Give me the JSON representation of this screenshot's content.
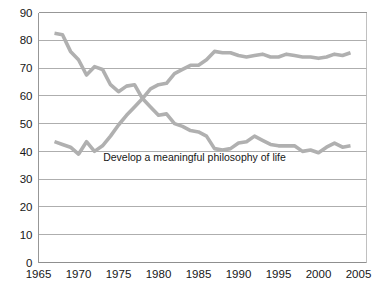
{
  "page": {
    "cropped_title_fragment": "",
    "background_color": "#ffffff"
  },
  "chart_data": {
    "type": "line",
    "title": "",
    "subtitle": "",
    "xlabel": "",
    "ylabel": "",
    "xlim": [
      1965,
      2006
    ],
    "ylim": [
      0,
      90
    ],
    "y_tick_labels": [
      "0",
      "10",
      "20",
      "30",
      "40",
      "50",
      "60",
      "70",
      "80",
      "90"
    ],
    "y_ticks": [
      0,
      10,
      20,
      30,
      40,
      50,
      60,
      70,
      80,
      90
    ],
    "x_tick_labels": [
      "1965",
      "1970",
      "1975",
      "1980",
      "1985",
      "1990",
      "1995",
      "2000",
      "2005"
    ],
    "x_ticks": [
      1965,
      1970,
      1975,
      1980,
      1985,
      1990,
      1995,
      2000,
      2005
    ],
    "grid": "horizontal",
    "legend_position": "inline-annotation",
    "annotations": [
      {
        "text": "Develop a meaningful philosophy of life",
        "x": 1984.5,
        "y": 36.5
      }
    ],
    "series": [
      {
        "name": "Develop a meaningful philosophy of life",
        "color": "#b0b0b0",
        "x": [
          1967,
          1968,
          1969,
          1970,
          1971,
          1972,
          1973,
          1974,
          1975,
          1976,
          1977,
          1978,
          1979,
          1980,
          1981,
          1982,
          1983,
          1984,
          1985,
          1986,
          1987,
          1988,
          1989,
          1990,
          1991,
          1992,
          1993,
          1994,
          1995,
          1996,
          1997,
          1998,
          1999,
          2000,
          2001,
          2002,
          2003,
          2004
        ],
        "values": [
          82.5,
          82.0,
          76.0,
          73.0,
          67.5,
          70.5,
          69.5,
          64.0,
          61.5,
          63.5,
          64.0,
          59.0,
          56.0,
          53.0,
          53.5,
          50.0,
          49.0,
          47.5,
          47.0,
          45.5,
          41.0,
          40.5,
          41.0,
          43.0,
          43.5,
          45.5,
          44.0,
          42.5,
          42.0,
          42.0,
          42.0,
          40.0,
          40.5,
          39.5,
          41.5,
          43.0,
          41.5,
          42.0
        ]
      },
      {
        "name": "Be very well off financially",
        "color": "#b0b0b0",
        "x": [
          1967,
          1968,
          1969,
          1970,
          1971,
          1972,
          1973,
          1974,
          1975,
          1976,
          1977,
          1978,
          1979,
          1980,
          1981,
          1982,
          1983,
          1984,
          1985,
          1986,
          1987,
          1988,
          1989,
          1990,
          1991,
          1992,
          1993,
          1994,
          1995,
          1996,
          1997,
          1998,
          1999,
          2000,
          2001,
          2002,
          2003,
          2004
        ],
        "values": [
          43.5,
          42.5,
          41.5,
          39.0,
          43.5,
          40.0,
          42.0,
          45.5,
          49.5,
          53.0,
          56.0,
          59.0,
          62.5,
          64.0,
          64.5,
          68.0,
          69.5,
          71.0,
          71.0,
          73.0,
          76.0,
          75.5,
          75.5,
          74.5,
          74.0,
          74.5,
          75.0,
          74.0,
          74.0,
          75.0,
          74.5,
          74.0,
          74.0,
          73.5,
          74.0,
          75.0,
          74.5,
          75.5
        ]
      }
    ]
  }
}
